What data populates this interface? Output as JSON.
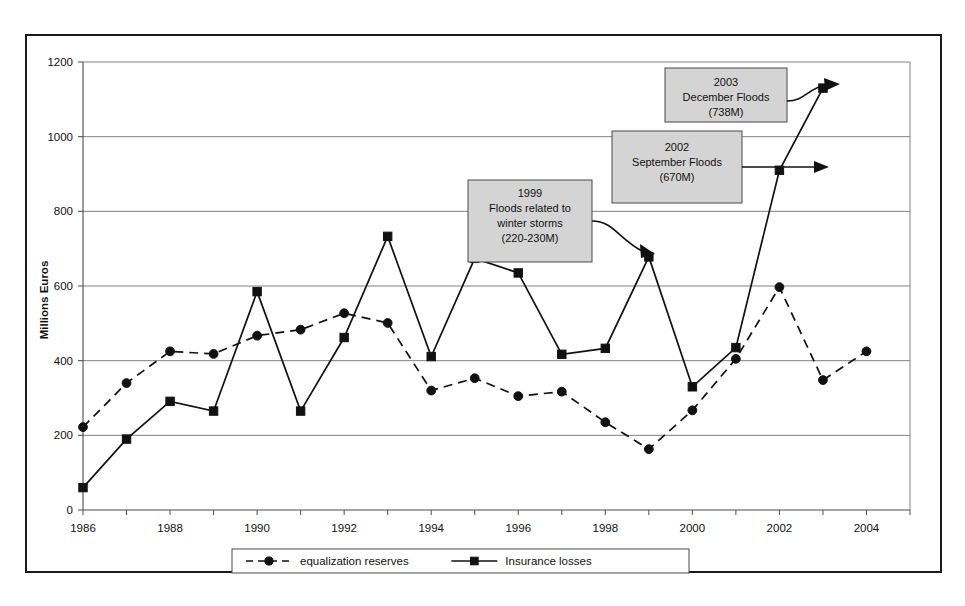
{
  "chart_data": {
    "type": "line",
    "title": "",
    "subtitle": "",
    "xlabel": "",
    "ylabel": "Millions Euros",
    "x": [
      1986,
      1987,
      1988,
      1989,
      1990,
      1991,
      1992,
      1993,
      1994,
      1995,
      1996,
      1997,
      1998,
      1999,
      2000,
      2001,
      2002,
      2003,
      2004
    ],
    "xlim": [
      1986,
      2005
    ],
    "ylim": [
      0,
      1200
    ],
    "ytick_labels": [
      "0",
      "200",
      "400",
      "600",
      "800",
      "1000",
      "1200"
    ],
    "ytick_values": [
      0,
      200,
      400,
      600,
      800,
      1000,
      1200
    ],
    "xtick_labels": [
      "1986",
      "1988",
      "1990",
      "1992",
      "1994",
      "1996",
      "1998",
      "2000",
      "2002",
      "2004"
    ],
    "xtick_values": [
      1986,
      1988,
      1990,
      1992,
      1994,
      1996,
      1998,
      2000,
      2002,
      2004
    ],
    "grid": "horizontal",
    "legend_position": "bottom-center",
    "series": [
      {
        "name": "equalization reserves",
        "style": "dashed",
        "marker": "circle",
        "x": [
          1986,
          1987,
          1988,
          1989,
          1990,
          1991,
          1992,
          1993,
          1994,
          1995,
          1996,
          1997,
          1998,
          1999,
          2000,
          2001,
          2002,
          2003,
          2004
        ],
        "values": [
          222,
          340,
          425,
          418,
          467,
          483,
          527,
          501,
          320,
          353,
          305,
          317,
          235,
          163,
          267,
          405,
          597,
          348,
          425
        ]
      },
      {
        "name": "Insurance losses",
        "style": "solid",
        "marker": "square",
        "x": [
          1986,
          1987,
          1988,
          1989,
          1990,
          1991,
          1992,
          1993,
          1994,
          1995,
          1996,
          1997,
          1998,
          1999,
          2000,
          2001,
          2002,
          2003
        ],
        "values": [
          60,
          190,
          291,
          265,
          585,
          265,
          462,
          733,
          411,
          674,
          635,
          417,
          433,
          678,
          330,
          435,
          910,
          1130
        ]
      }
    ],
    "annotations": [
      {
        "id": "annotation-1999-floods",
        "lines": [
          "1999",
          "Floods related to",
          "winter storms",
          "(220-230M)"
        ],
        "target_x": 1999,
        "target_y": 678
      },
      {
        "id": "annotation-2002-september-floods",
        "lines": [
          "2002",
          "September Floods",
          "(670M)"
        ],
        "target_x": 2002,
        "target_y": 910
      },
      {
        "id": "annotation-2003-december-floods",
        "lines": [
          "2003",
          "December Floods",
          "(738M)"
        ],
        "target_x": 2003,
        "target_y": 1130
      }
    ]
  },
  "legend": {
    "entries": [
      {
        "label": "equalization reserves",
        "style": "dashed",
        "marker": "circle"
      },
      {
        "label": "Insurance losses",
        "style": "solid",
        "marker": "square"
      }
    ]
  },
  "axis": {
    "y_title": "Millions Euros"
  },
  "colors": {
    "line": "#111111",
    "grid": "#808080",
    "axis": "#4d4d4d",
    "callout_fill": "#d4d4d4",
    "callout_border": "#4a4a4a",
    "frame": "#1a1a1a",
    "background": "#ffffff"
  }
}
